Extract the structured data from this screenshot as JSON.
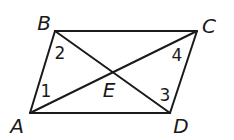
{
  "figure": {
    "type": "parallelogram with diagonals",
    "stroke_color": "#1a1a1a",
    "background": "#ffffff",
    "vertices": {
      "A": {
        "label": "A",
        "x": 30,
        "y": 113,
        "label_x": 17,
        "label_y": 126
      },
      "B": {
        "label": "B",
        "x": 55,
        "y": 31,
        "label_x": 44,
        "label_y": 23
      },
      "C": {
        "label": "C",
        "x": 197,
        "y": 31,
        "label_x": 209,
        "label_y": 26
      },
      "D": {
        "label": "D",
        "x": 170,
        "y": 113,
        "label_x": 181,
        "label_y": 126
      },
      "E": {
        "label": "E",
        "x": 112,
        "y": 72,
        "label_x": 109,
        "label_y": 90
      }
    },
    "segments": [
      {
        "name": "AB",
        "from": "A",
        "to": "B"
      },
      {
        "name": "BC",
        "from": "B",
        "to": "C"
      },
      {
        "name": "CD",
        "from": "C",
        "to": "D"
      },
      {
        "name": "DA",
        "from": "D",
        "to": "A"
      },
      {
        "name": "AC",
        "from": "A",
        "to": "C"
      },
      {
        "name": "BD",
        "from": "B",
        "to": "D"
      }
    ],
    "angles": [
      {
        "label": "1",
        "vertex": "A",
        "between": "AB and AC",
        "x": 46,
        "y": 91
      },
      {
        "label": "2",
        "vertex": "B",
        "between": "BA and BD",
        "x": 60,
        "y": 53
      },
      {
        "label": "3",
        "vertex": "D",
        "between": "DB and DC",
        "x": 165,
        "y": 95
      },
      {
        "label": "4",
        "vertex": "C",
        "between": "CA and CD",
        "x": 177,
        "y": 55
      }
    ]
  }
}
